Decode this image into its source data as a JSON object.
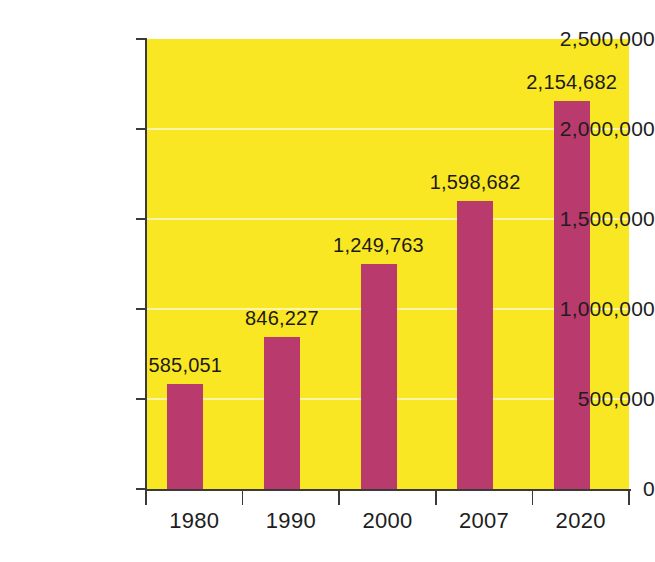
{
  "chart_data": {
    "type": "bar",
    "title": "",
    "subtitle": "",
    "xlabel": "",
    "ylabel": "",
    "categories": [
      "1980",
      "1990",
      "2000",
      "2007",
      "2020"
    ],
    "values": [
      585051,
      846227,
      1249763,
      1598682,
      2154682
    ],
    "value_labels": [
      "585,051",
      "846,227",
      "1,249,763",
      "1,598,682",
      "2,154,682"
    ],
    "ylim": [
      0,
      2500000
    ],
    "ytick_values": [
      0,
      500000,
      1000000,
      1500000,
      2000000,
      2500000
    ],
    "ytick_labels": [
      "0",
      "500,000",
      "1,000,000",
      "1,500,000",
      "2,000,000",
      "2,500,000"
    ],
    "grid": true,
    "gridlines_at": [
      500000,
      1000000,
      1500000,
      2000000
    ],
    "legend": null,
    "legend_position": "none",
    "colors": {
      "bar": "#b93a6c",
      "plot_background": "#fae723",
      "gridline": "#fdf6a8",
      "axis": "#3a3a38",
      "text": "#201d1c",
      "page_background": "#ffffff"
    }
  }
}
